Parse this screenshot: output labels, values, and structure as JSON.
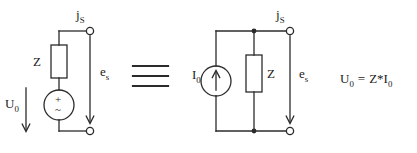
{
  "diagram": {
    "equivalence_symbol": "≡",
    "stroke_color": "#2b2b2b",
    "background_color": "#ffffff",
    "relation": "U₀ = Z*I₀"
  },
  "thevenin": {
    "name": "thevenin-equivalent-circuit",
    "impedance_label": "Z",
    "source_label_plus": "+",
    "source_label_wave": "~",
    "voltage_label": "U",
    "voltage_sub": "0",
    "current_label": "j",
    "current_sub": "S",
    "emf_label": "e",
    "emf_sub": "s"
  },
  "norton": {
    "name": "norton-equivalent-circuit",
    "impedance_label": "Z",
    "current_source_label": "I",
    "current_source_sub": "0",
    "current_label": "j",
    "current_sub": "S",
    "emf_label": "e",
    "emf_sub": "s"
  },
  "equation": {
    "lhs": "U",
    "lhs_sub": "0",
    "operator": "=",
    "rhs_impedance": "Z",
    "rhs_times": "*",
    "rhs_current": "I",
    "rhs_current_sub": "0"
  }
}
